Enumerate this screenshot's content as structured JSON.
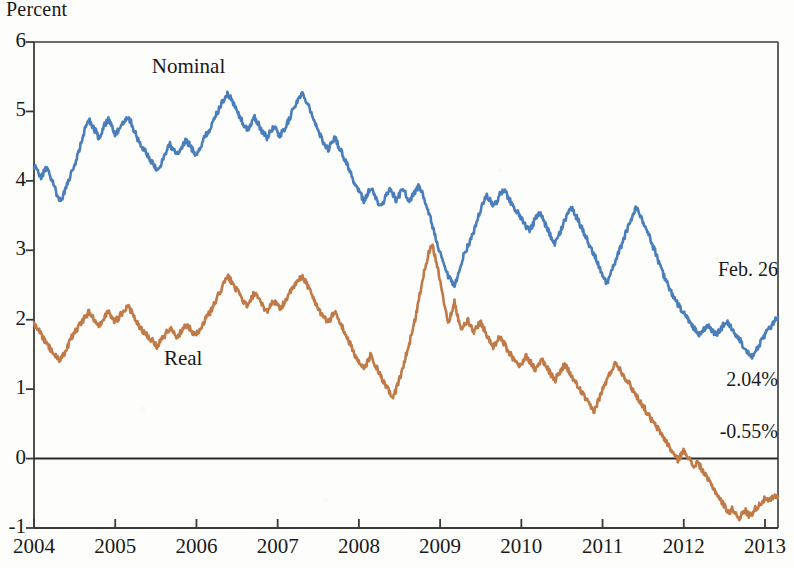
{
  "chart_data": {
    "type": "line",
    "title": "",
    "xlabel": "",
    "ylabel": "Percent",
    "ylim": [
      -1,
      6
    ],
    "xlim": [
      2004,
      2013.16
    ],
    "grid": false,
    "legend": "inline-annotations",
    "ytick_labels": [
      "6",
      "5",
      "4",
      "3",
      "2",
      "1",
      "0",
      "-1"
    ],
    "ytick_values": [
      6,
      5,
      4,
      3,
      2,
      1,
      0,
      -1
    ],
    "xtick_labels": [
      "2004",
      "2005",
      "2006",
      "2007",
      "2008",
      "2009",
      "2010",
      "2011",
      "2012",
      "2013"
    ],
    "xtick_values": [
      2004,
      2005,
      2006,
      2007,
      2008,
      2009,
      2010,
      2011,
      2012,
      2013
    ],
    "zero_line": 0,
    "series": [
      {
        "name": "Nominal",
        "color": "#4a7ebb",
        "label_x": 2005.45,
        "label_y": 5.62,
        "end_value": 2.04,
        "values": [
          4.22,
          4.15,
          4.05,
          4.12,
          4.18,
          4.08,
          3.95,
          3.82,
          3.72,
          3.78,
          3.92,
          4.05,
          4.15,
          4.28,
          4.45,
          4.62,
          4.78,
          4.88,
          4.8,
          4.72,
          4.62,
          4.7,
          4.82,
          4.88,
          4.78,
          4.66,
          4.72,
          4.8,
          4.88,
          4.92,
          4.85,
          4.72,
          4.6,
          4.52,
          4.45,
          4.38,
          4.3,
          4.22,
          4.15,
          4.22,
          4.32,
          4.45,
          4.52,
          4.45,
          4.38,
          4.42,
          4.5,
          4.58,
          4.52,
          4.45,
          4.38,
          4.45,
          4.55,
          4.65,
          4.72,
          4.8,
          4.92,
          5.02,
          5.12,
          5.2,
          5.25,
          5.18,
          5.08,
          4.98,
          4.88,
          4.8,
          4.72,
          4.82,
          4.92,
          4.85,
          4.75,
          4.68,
          4.62,
          4.7,
          4.78,
          4.72,
          4.65,
          4.72,
          4.8,
          4.9,
          5.02,
          5.12,
          5.2,
          5.25,
          5.18,
          5.08,
          4.95,
          4.82,
          4.7,
          4.6,
          4.52,
          4.45,
          4.55,
          4.62,
          4.52,
          4.42,
          4.32,
          4.22,
          4.1,
          3.98,
          3.88,
          3.8,
          3.72,
          3.8,
          3.9,
          3.82,
          3.72,
          3.62,
          3.7,
          3.82,
          3.88,
          3.8,
          3.72,
          3.8,
          3.88,
          3.8,
          3.72,
          3.78,
          3.86,
          3.92,
          3.82,
          3.7,
          3.55,
          3.38,
          3.2,
          3.02,
          2.88,
          2.75,
          2.62,
          2.55,
          2.48,
          2.62,
          2.8,
          2.95,
          3.05,
          3.15,
          3.28,
          3.42,
          3.58,
          3.7,
          3.8,
          3.72,
          3.62,
          3.7,
          3.8,
          3.88,
          3.82,
          3.72,
          3.65,
          3.58,
          3.5,
          3.42,
          3.35,
          3.28,
          3.35,
          3.45,
          3.55,
          3.48,
          3.38,
          3.28,
          3.18,
          3.08,
          3.18,
          3.3,
          3.42,
          3.52,
          3.62,
          3.55,
          3.45,
          3.35,
          3.25,
          3.15,
          3.05,
          2.95,
          2.85,
          2.72,
          2.6,
          2.52,
          2.62,
          2.75,
          2.88,
          3.0,
          3.12,
          3.25,
          3.38,
          3.5,
          3.62,
          3.55,
          3.45,
          3.35,
          3.22,
          3.1,
          2.98,
          2.85,
          2.72,
          2.6,
          2.5,
          2.4,
          2.3,
          2.22,
          2.15,
          2.08,
          2.02,
          1.95,
          1.88,
          1.82,
          1.78,
          1.85,
          1.92,
          1.88,
          1.82,
          1.78,
          1.85,
          1.92,
          1.98,
          1.92,
          1.85,
          1.78,
          1.72,
          1.65,
          1.58,
          1.52,
          1.48,
          1.55,
          1.62,
          1.7,
          1.78,
          1.85,
          1.92,
          1.98,
          2.04
        ]
      },
      {
        "name": "Real",
        "color": "#c07a48",
        "label_x": 2005.6,
        "label_y": 1.42,
        "end_value": -0.55,
        "values": [
          1.95,
          1.88,
          1.8,
          1.72,
          1.65,
          1.58,
          1.52,
          1.45,
          1.4,
          1.48,
          1.58,
          1.68,
          1.78,
          1.85,
          1.92,
          1.98,
          2.05,
          2.12,
          2.05,
          1.98,
          1.92,
          1.98,
          2.05,
          2.12,
          2.05,
          1.98,
          2.02,
          2.08,
          2.15,
          2.2,
          2.12,
          2.02,
          1.95,
          1.88,
          1.82,
          1.78,
          1.72,
          1.68,
          1.62,
          1.68,
          1.75,
          1.82,
          1.88,
          1.82,
          1.76,
          1.8,
          1.86,
          1.92,
          1.88,
          1.82,
          1.78,
          1.85,
          1.92,
          2.0,
          2.08,
          2.15,
          2.25,
          2.35,
          2.45,
          2.55,
          2.62,
          2.55,
          2.48,
          2.4,
          2.32,
          2.25,
          2.18,
          2.28,
          2.38,
          2.32,
          2.25,
          2.18,
          2.12,
          2.2,
          2.28,
          2.22,
          2.15,
          2.22,
          2.3,
          2.38,
          2.45,
          2.52,
          2.58,
          2.62,
          2.55,
          2.45,
          2.35,
          2.25,
          2.15,
          2.08,
          2.02,
          1.95,
          2.05,
          2.12,
          2.02,
          1.92,
          1.82,
          1.72,
          1.62,
          1.52,
          1.42,
          1.35,
          1.28,
          1.38,
          1.48,
          1.4,
          1.3,
          1.2,
          1.1,
          1.02,
          0.95,
          0.88,
          1.0,
          1.15,
          1.3,
          1.48,
          1.65,
          1.85,
          2.05,
          2.3,
          2.55,
          2.78,
          2.95,
          3.1,
          2.92,
          2.7,
          2.45,
          2.2,
          1.95,
          2.1,
          2.25,
          2.05,
          1.85,
          1.92,
          2.0,
          1.92,
          1.82,
          1.9,
          1.98,
          1.88,
          1.78,
          1.68,
          1.6,
          1.68,
          1.75,
          1.68,
          1.6,
          1.52,
          1.45,
          1.38,
          1.32,
          1.4,
          1.48,
          1.42,
          1.35,
          1.28,
          1.35,
          1.42,
          1.35,
          1.28,
          1.2,
          1.12,
          1.2,
          1.28,
          1.35,
          1.28,
          1.2,
          1.12,
          1.05,
          0.98,
          0.9,
          0.82,
          0.75,
          0.68,
          0.78,
          0.9,
          1.02,
          1.12,
          1.22,
          1.32,
          1.38,
          1.3,
          1.22,
          1.15,
          1.08,
          1.0,
          0.92,
          0.85,
          0.78,
          0.7,
          0.62,
          0.55,
          0.48,
          0.42,
          0.35,
          0.28,
          0.2,
          0.12,
          0.05,
          -0.02,
          0.05,
          0.12,
          0.05,
          -0.05,
          -0.12,
          -0.05,
          -0.12,
          -0.2,
          -0.28,
          -0.35,
          -0.42,
          -0.5,
          -0.58,
          -0.65,
          -0.72,
          -0.78,
          -0.72,
          -0.8,
          -0.85,
          -0.8,
          -0.75,
          -0.82,
          -0.78,
          -0.72,
          -0.68,
          -0.62,
          -0.58,
          -0.62,
          -0.58,
          -0.55,
          -0.55
        ]
      }
    ],
    "annotations": [
      {
        "name": "as-of-date",
        "text": "Feb. 26"
      },
      {
        "name": "nominal-value",
        "text": "2.04%"
      },
      {
        "name": "real-value",
        "text": "-0.55%"
      }
    ]
  }
}
